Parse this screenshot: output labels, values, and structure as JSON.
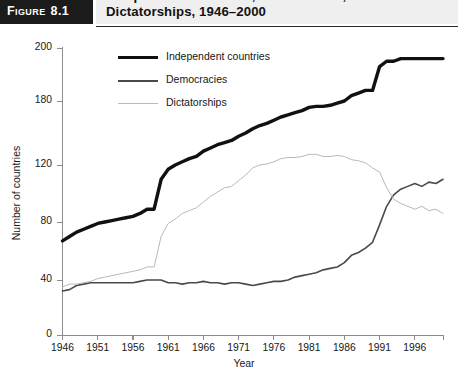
{
  "figure": {
    "tab_word": "Figure",
    "tab_number": "8.1",
    "title": "Independent Countries, Democracies, and Dictatorships, 1946–2000"
  },
  "chart_data": {
    "type": "line",
    "title": "Independent Countries, Democracies, and Dictatorships, 1946–2000",
    "xlabel": "Year",
    "ylabel": "Number of countries",
    "xlim": [
      1946,
      2000
    ],
    "ylim": [
      0,
      200
    ],
    "grid": false,
    "legend_position": "top-center",
    "ytick_labels": [
      "0",
      "40",
      "80",
      "120",
      "180",
      "200"
    ],
    "ytick_values": [
      0,
      40,
      80,
      120,
      180,
      200
    ],
    "xtick_labels": [
      "1946",
      "1951",
      "1956",
      "1961",
      "1966",
      "1971",
      "1976",
      "1981",
      "1986",
      "1991",
      "1996"
    ],
    "xtick_values": [
      1946,
      1951,
      1956,
      1961,
      1966,
      1971,
      1976,
      1981,
      1986,
      1991,
      1996
    ],
    "x": [
      1946,
      1947,
      1948,
      1949,
      1950,
      1951,
      1952,
      1953,
      1954,
      1955,
      1956,
      1957,
      1958,
      1959,
      1960,
      1961,
      1962,
      1963,
      1964,
      1965,
      1966,
      1967,
      1968,
      1969,
      1970,
      1971,
      1972,
      1973,
      1974,
      1975,
      1976,
      1977,
      1978,
      1979,
      1980,
      1981,
      1982,
      1983,
      1984,
      1985,
      1986,
      1987,
      1988,
      1989,
      1990,
      1991,
      1992,
      1993,
      1994,
      1995,
      1996,
      1997,
      1998,
      1999,
      2000
    ],
    "series": [
      {
        "name": "Independent countries",
        "color": "#111111",
        "width": 3.4,
        "values": [
          67,
          70,
          73,
          75,
          77,
          79,
          80,
          81,
          82,
          83,
          84,
          86,
          89,
          89,
          110,
          117,
          120,
          123,
          126,
          128,
          133,
          136,
          139,
          141,
          143,
          147,
          150,
          154,
          157,
          159,
          162,
          165,
          167,
          169,
          171,
          174,
          175,
          175,
          176,
          178,
          180,
          182,
          183,
          184,
          184,
          193,
          195,
          195,
          196,
          196,
          196,
          196,
          196,
          196,
          196
        ]
      },
      {
        "name": "Democracies",
        "color": "#4a4a4a",
        "width": 1.6,
        "values": [
          32,
          33,
          36,
          37,
          38,
          38,
          38,
          38,
          38,
          38,
          38,
          39,
          40,
          40,
          40,
          38,
          38,
          37,
          38,
          38,
          39,
          38,
          38,
          37,
          38,
          38,
          37,
          36,
          37,
          38,
          39,
          39,
          40,
          42,
          43,
          44,
          45,
          47,
          48,
          49,
          52,
          57,
          59,
          62,
          66,
          78,
          91,
          99,
          103,
          105,
          107,
          105,
          108,
          107,
          110
        ]
      },
      {
        "name": "Dictatorships",
        "color": "#b9b9b9",
        "width": 1.0,
        "values": [
          35,
          37,
          37,
          38,
          39,
          41,
          42,
          43,
          44,
          45,
          46,
          47,
          49,
          49,
          70,
          79,
          82,
          86,
          88,
          90,
          94,
          98,
          101,
          104,
          105,
          109,
          113,
          118,
          120,
          121,
          123,
          126,
          127,
          127,
          128,
          130,
          130,
          128,
          128,
          129,
          128,
          125,
          124,
          122,
          118,
          115,
          104,
          96,
          93,
          91,
          89,
          91,
          88,
          89,
          86
        ]
      }
    ],
    "annotations": [
      "Sharp rise in independent countries around 1960 (African decolonization)",
      "Step increase around 1991 (dissolution of the USSR and Yugoslavia)",
      "Democracies overtake dictatorships around 1991–1992"
    ]
  }
}
